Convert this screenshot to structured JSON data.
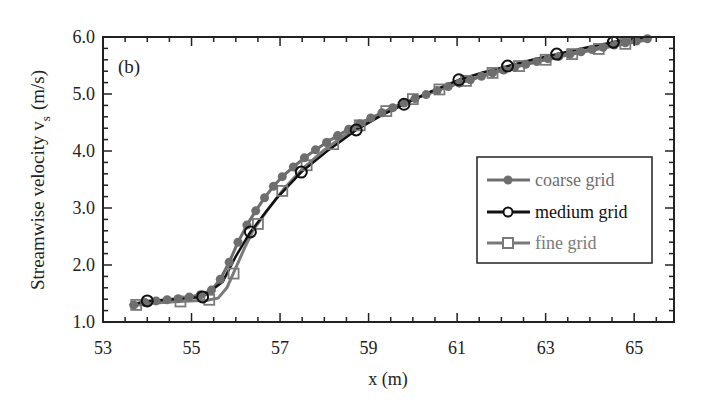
{
  "chart_data": {
    "type": "line",
    "title": "",
    "panel_label": "(b)",
    "xlabel": "x (m)",
    "ylabel": "Streamwise velocity v",
    "ylabel_subscript": "s",
    "ylabel_units": "(m/s)",
    "xlim": [
      53,
      65.9
    ],
    "ylim": [
      1.0,
      6.0
    ],
    "x_ticks": [
      53,
      55,
      57,
      59,
      61,
      63,
      65
    ],
    "x_tick_labels": [
      "53",
      "55",
      "57",
      "59",
      "61",
      "63",
      "65"
    ],
    "y_ticks": [
      1.0,
      2.0,
      3.0,
      4.0,
      5.0,
      6.0
    ],
    "y_tick_labels": [
      "1.0",
      "2.0",
      "3.0",
      "4.0",
      "5.0",
      "6.0"
    ],
    "grid": false,
    "legend_position": "right-center",
    "series": [
      {
        "name": "coarse grid",
        "marker": "filled-circle",
        "color": "#6e6e6e",
        "x": [
          53.7,
          53.95,
          54.2,
          54.45,
          54.7,
          54.95,
          55.2,
          55.45,
          55.65,
          55.85,
          56.05,
          56.25,
          56.45,
          56.65,
          56.85,
          57.05,
          57.3,
          57.55,
          57.8,
          58.05,
          58.3,
          58.55,
          58.8,
          59.05,
          59.3,
          59.55,
          59.8,
          60.05,
          60.3,
          60.55,
          60.8,
          61.05,
          61.3,
          61.55,
          61.8,
          62.05,
          62.3,
          62.55,
          62.8,
          63.05,
          63.3,
          63.55,
          63.8,
          64.05,
          64.3,
          64.55,
          64.8,
          65.05,
          65.3
        ],
        "y": [
          1.3,
          1.34,
          1.37,
          1.39,
          1.41,
          1.44,
          1.48,
          1.56,
          1.75,
          2.05,
          2.4,
          2.7,
          2.95,
          3.18,
          3.38,
          3.55,
          3.72,
          3.88,
          4.02,
          4.15,
          4.27,
          4.38,
          4.48,
          4.58,
          4.67,
          4.76,
          4.84,
          4.92,
          4.99,
          5.06,
          5.13,
          5.19,
          5.25,
          5.31,
          5.37,
          5.42,
          5.47,
          5.52,
          5.57,
          5.62,
          5.66,
          5.7,
          5.74,
          5.78,
          5.82,
          5.86,
          5.9,
          5.93,
          5.97
        ]
      },
      {
        "name": "medium grid",
        "marker": "open-circle",
        "color": "#111111",
        "x": [
          53.6,
          54.0,
          54.6,
          55.25,
          55.7,
          56.0,
          56.33,
          56.9,
          57.48,
          58.1,
          58.72,
          59.3,
          59.8,
          60.4,
          61.04,
          61.6,
          62.14,
          62.7,
          63.25,
          63.9,
          64.53,
          65.2
        ],
        "y": [
          1.3,
          1.37,
          1.4,
          1.44,
          1.7,
          2.15,
          2.58,
          3.15,
          3.63,
          4.02,
          4.37,
          4.63,
          4.82,
          5.04,
          5.25,
          5.38,
          5.49,
          5.6,
          5.7,
          5.81,
          5.91,
          5.99
        ],
        "marker_x": [
          54.0,
          55.25,
          56.33,
          57.48,
          58.72,
          59.8,
          61.04,
          62.14,
          63.25,
          64.53
        ],
        "marker_y": [
          1.37,
          1.44,
          2.58,
          3.63,
          4.37,
          4.82,
          5.25,
          5.49,
          5.7,
          5.91
        ]
      },
      {
        "name": "fine grid",
        "marker": "open-square",
        "color": "#7a7a7a",
        "x": [
          53.6,
          54.1,
          54.7,
          55.35,
          55.6,
          55.8,
          56.0,
          56.2,
          56.4,
          56.7,
          57.1,
          57.5,
          58.0,
          58.5,
          59.0,
          59.5,
          60.0,
          60.6,
          61.2,
          61.8,
          62.4,
          63.0,
          63.6,
          64.2,
          64.8,
          65.3
        ],
        "y": [
          1.28,
          1.33,
          1.36,
          1.38,
          1.42,
          1.6,
          1.95,
          2.3,
          2.62,
          2.95,
          3.35,
          3.68,
          4.02,
          4.3,
          4.54,
          4.74,
          4.91,
          5.08,
          5.23,
          5.37,
          5.49,
          5.6,
          5.7,
          5.79,
          5.88,
          5.95
        ],
        "marker_x": [
          53.75,
          54.75,
          55.4,
          55.95,
          56.5,
          57.05,
          57.6,
          58.2,
          58.8,
          59.4,
          60.0,
          60.6,
          61.2,
          61.8,
          62.4,
          63.0,
          63.6,
          64.2,
          64.8
        ],
        "marker_y": [
          1.3,
          1.36,
          1.39,
          1.85,
          2.72,
          3.3,
          3.75,
          4.12,
          4.45,
          4.7,
          4.91,
          5.08,
          5.23,
          5.37,
          5.49,
          5.6,
          5.7,
          5.79,
          5.88
        ]
      }
    ]
  }
}
